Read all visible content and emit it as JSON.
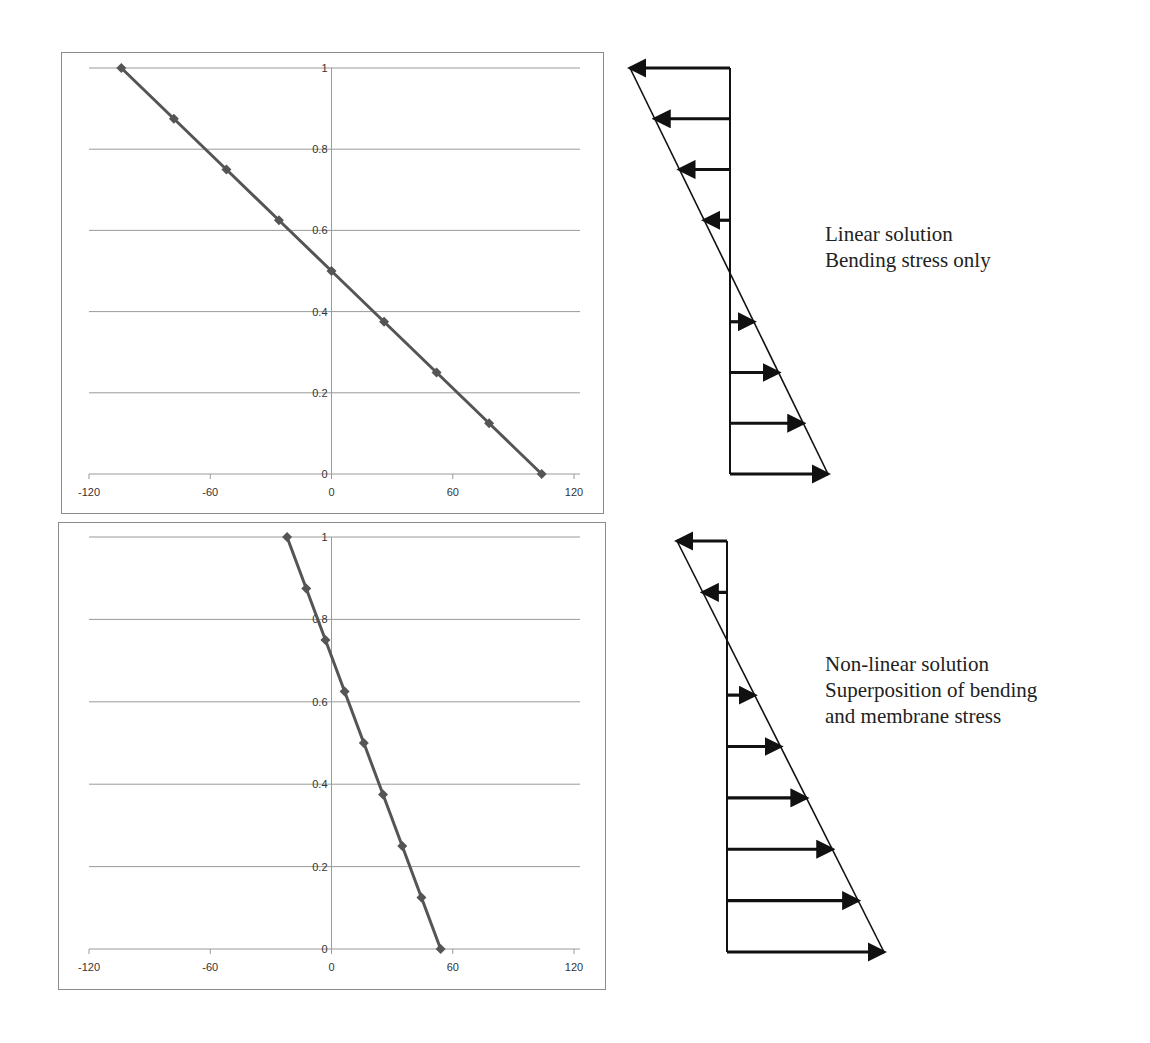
{
  "chart_data": [
    {
      "type": "line",
      "title": "",
      "xlabel": "",
      "ylabel": "",
      "xlim": [
        -120,
        120
      ],
      "ylim": [
        0,
        1
      ],
      "x_ticks": [
        -120,
        -60,
        0,
        60,
        120
      ],
      "y_ticks": [
        0,
        0.2,
        0.4,
        0.6,
        0.8,
        1
      ],
      "grid": {
        "horizontal": true,
        "vertical": false
      },
      "legend": null,
      "series": [
        {
          "name": "Linear solution",
          "marker": "diamond",
          "color": "#555555",
          "x": [
            104,
            78,
            52,
            26,
            0,
            -26,
            -52,
            -78,
            -104
          ],
          "y": [
            0,
            0.125,
            0.25,
            0.375,
            0.5,
            0.625,
            0.75,
            0.875,
            1
          ]
        }
      ]
    },
    {
      "type": "line",
      "title": "",
      "xlabel": "",
      "ylabel": "",
      "xlim": [
        -120,
        120
      ],
      "ylim": [
        0,
        1
      ],
      "x_ticks": [
        -120,
        -60,
        0,
        60,
        120
      ],
      "y_ticks": [
        0,
        0.2,
        0.4,
        0.6,
        0.8,
        1
      ],
      "grid": {
        "horizontal": true,
        "vertical": false
      },
      "legend": null,
      "series": [
        {
          "name": "Non-linear solution",
          "marker": "diamond",
          "color": "#555555",
          "x": [
            54,
            44.5,
            35,
            25.5,
            16,
            6.5,
            -3,
            -12.5,
            -22
          ],
          "y": [
            0,
            0.125,
            0.25,
            0.375,
            0.5,
            0.625,
            0.75,
            0.875,
            1
          ]
        }
      ]
    }
  ],
  "charts": {
    "x_tick_labels": [
      "-120",
      "-60",
      "0",
      "60",
      "120"
    ],
    "y_tick_labels": [
      "0",
      "0.2",
      "0.4",
      "0.6",
      "0.8",
      "1"
    ]
  },
  "diagrams": {
    "linear": {
      "caption": [
        "Linear solution",
        "Bending stress only"
      ],
      "arrow_count": 8,
      "zero_crossing_fraction": 0.5
    },
    "nonlinear": {
      "caption": [
        "Non-linear solution",
        "Superposition of bending",
        "and membrane stress"
      ],
      "arrow_count": 8,
      "zero_crossing_fraction": 0.236
    }
  },
  "colors": {
    "series": "#555555",
    "grid": "#9a9a9a",
    "frame": "#8a8a8a",
    "arrow": "#111111"
  }
}
